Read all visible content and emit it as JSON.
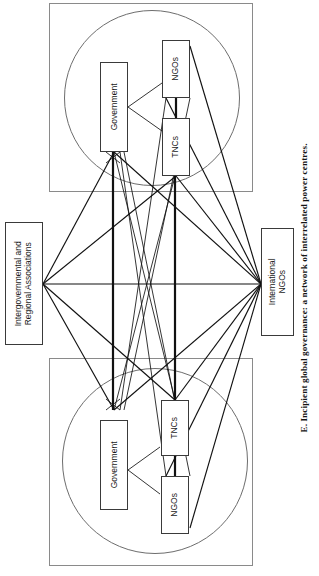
{
  "figure": {
    "caption": "E.  Incipient global governance: a network of interrelated power centres.",
    "caption_letter": "E.",
    "caption_text": "Incipient global governance: a network of interrelated power centres.",
    "orientation": "rotated-90-counterclockwise",
    "type": "network-diagram"
  },
  "nodes": {
    "left_association": {
      "label": "Intergovernmental and\nRegional Associations"
    },
    "right_ingo": {
      "label": "International\nNGOs"
    },
    "cluster_top": {
      "government": {
        "label": "Government"
      },
      "ngos": {
        "label": "NGOs"
      },
      "tncs": {
        "label": "TNCs"
      }
    },
    "cluster_bottom": {
      "government": {
        "label": "Government"
      },
      "tncs": {
        "label": "TNCs"
      },
      "ngos": {
        "label": "NGOs"
      }
    }
  },
  "clusters": [
    {
      "name": "power-centre-top",
      "shape": "square-with-inscribed-circle",
      "members": [
        "Government",
        "NGOs",
        "TNCs"
      ]
    },
    {
      "name": "power-centre-bottom",
      "shape": "square-with-inscribed-circle",
      "members": [
        "Government",
        "TNCs",
        "NGOs"
      ]
    }
  ],
  "colors": {
    "line": "#111111",
    "frame": "#8a8a8a",
    "circle": "#6d6d6d",
    "box_border": "#3a3a3a",
    "background": "#ffffff",
    "text": "#1a1a1a"
  }
}
